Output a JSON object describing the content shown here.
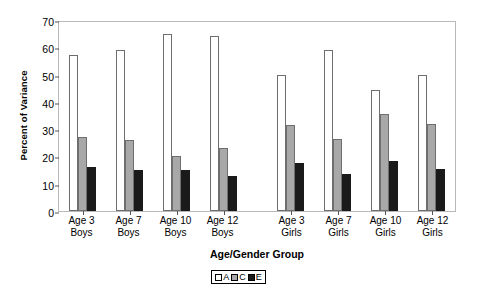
{
  "chart_data": {
    "type": "bar",
    "title": "",
    "xlabel": "Age/Gender Group",
    "ylabel": "Percent of Variance",
    "ylim": [
      0,
      70
    ],
    "yticks": [
      0,
      10,
      20,
      30,
      40,
      50,
      60,
      70
    ],
    "grid": false,
    "legend_position": "bottom-center",
    "categories": [
      "Age 3 Boys",
      "Age 7 Boys",
      "Age 10 Boys",
      "Age 12 Boys",
      "Age 3 Girls",
      "Age 7 Girls",
      "Age 10 Girls",
      "Age 12 Girls"
    ],
    "category_lines": [
      [
        "Age 3",
        "Boys"
      ],
      [
        "Age 7",
        "Boys"
      ],
      [
        "Age 10",
        "Boys"
      ],
      [
        "Age 12",
        "Boys"
      ],
      [
        "Age 3",
        "Girls"
      ],
      [
        "Age 7",
        "Girls"
      ],
      [
        "Age 10",
        "Girls"
      ],
      [
        "Age 12",
        "Girls"
      ]
    ],
    "series": [
      {
        "name": "A",
        "color": "#ffffff",
        "values": [
          57,
          59,
          65,
          64,
          50,
          59,
          44.5,
          50
        ]
      },
      {
        "name": "C",
        "color": "#a8a8a8",
        "values": [
          27,
          26,
          20,
          23,
          31.5,
          26.5,
          35.5,
          32
        ]
      },
      {
        "name": "E",
        "color": "#1a1a1a",
        "values": [
          16,
          15,
          15,
          13,
          17.5,
          13.5,
          18.5,
          15.5
        ]
      }
    ],
    "blocks": [
      {
        "name": "Boys",
        "category_indices": [
          0,
          1,
          2,
          3
        ]
      },
      {
        "name": "Girls",
        "category_indices": [
          4,
          5,
          6,
          7
        ]
      }
    ]
  },
  "legend": {
    "items": [
      {
        "label": "A",
        "swatch": "open-square-swatch"
      },
      {
        "label": "C",
        "swatch": "gray-square-swatch"
      },
      {
        "label": "E",
        "swatch": "black-square-swatch"
      }
    ]
  }
}
